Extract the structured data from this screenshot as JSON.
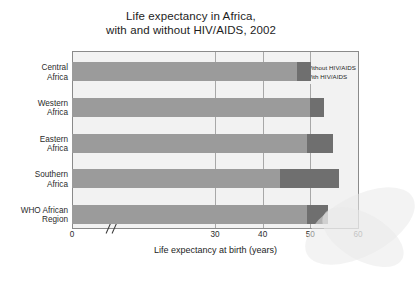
{
  "chart_data": {
    "type": "bar",
    "orientation": "horizontal",
    "stacked_overlay": true,
    "title": "Life expectancy in Africa, with and without HIV/AIDS, 2002",
    "title_line1": "Life expectancy in Africa,",
    "title_line2": "with and without HIV/AIDS, 2002",
    "xlabel": "Life expectancy at birth (years)",
    "ylabel": "",
    "xlim": [
      0,
      60
    ],
    "xticks": [
      0,
      30,
      40,
      50,
      60
    ],
    "xtick_labels": [
      "0",
      "30",
      "40",
      "50",
      "60"
    ],
    "axis_break_after": 0,
    "grid": true,
    "legend_position": "top-right",
    "categories": [
      "Central Africa",
      "Western Africa",
      "Eastern Africa",
      "Southern Africa",
      "WHO African Region"
    ],
    "category_lines": [
      [
        "Central",
        "Africa"
      ],
      [
        "Western",
        "Africa"
      ],
      [
        "Eastern",
        "Africa"
      ],
      [
        "Southern",
        "Africa"
      ],
      [
        "WHO African",
        "Region"
      ]
    ],
    "series": [
      {
        "name": "With HIV/AIDS",
        "color": "#9b9b9b",
        "values": [
          47.2,
          50.0,
          49.3,
          43.6,
          49.3
        ]
      },
      {
        "name": "Without HIV/AIDS",
        "color": "#6f6f6f",
        "values": [
          50.1,
          52.9,
          54.7,
          56.0,
          53.8
        ]
      }
    ],
    "legend": [
      {
        "label": "Without HIV/AIDS",
        "color": "#6f6f6f"
      },
      {
        "label": "With HIV/AIDS",
        "color": "#9b9b9b"
      }
    ],
    "colors": {
      "with_hiv": "#9b9b9b",
      "without_hiv": "#6f6f6f",
      "plot_background": "#f2f2f2",
      "frame": "#8a8a8a",
      "gridline": "#a8a8a8",
      "text": "#1d1d1d"
    }
  }
}
